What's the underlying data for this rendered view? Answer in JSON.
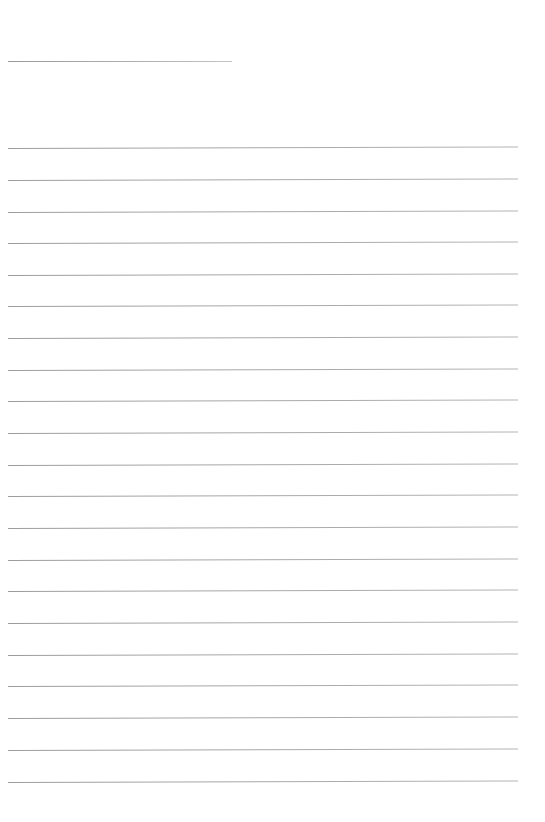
{
  "page": {
    "type": "blank-lined-paper",
    "background_color": "#ffffff",
    "line_color": "#a6a6a6"
  },
  "header_line": {
    "x": 8,
    "y": 61,
    "width": 224
  },
  "ruled_lines": {
    "count": 21,
    "x": 8,
    "width": 510,
    "y_positions": [
      148,
      180,
      212,
      243,
      275,
      306,
      338,
      370,
      401,
      433,
      465,
      496,
      528,
      560,
      591,
      623,
      655,
      686,
      718,
      750,
      782
    ]
  }
}
